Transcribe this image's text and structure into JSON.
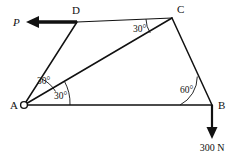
{
  "figure": {
    "background_color": "#ffffff",
    "line_color": "#111111"
  },
  "vertices": {
    "a": {
      "label": "A",
      "x": 24,
      "y": 105,
      "support": "pin-support-circle"
    },
    "b": {
      "label": "B",
      "x": 212,
      "y": 105
    },
    "c": {
      "label": "C",
      "x": 172,
      "y": 18
    },
    "d": {
      "label": "D",
      "x": 77,
      "y": 22
    }
  },
  "members": [
    {
      "name": "member-a-b",
      "from": "A",
      "to": "B"
    },
    {
      "name": "member-a-d",
      "from": "A",
      "to": "D"
    },
    {
      "name": "member-a-c",
      "from": "A",
      "to": "C"
    },
    {
      "name": "member-d-c",
      "from": "D",
      "to": "C"
    },
    {
      "name": "member-c-b",
      "from": "C",
      "to": "B"
    }
  ],
  "angles": [
    {
      "name": "angle-at-a-upper",
      "value": "30°",
      "at": "A",
      "between": "AD and AC",
      "label_x": 37,
      "label_y": 84
    },
    {
      "name": "angle-at-a-lower",
      "value": "30°",
      "at": "A",
      "between": "AC and AB",
      "label_x": 54,
      "label_y": 98
    },
    {
      "name": "angle-at-c",
      "value": "30°",
      "at": "C",
      "between": "CD and CA",
      "label_x": 136,
      "label_y": 32
    },
    {
      "name": "angle-at-b",
      "value": "60°",
      "at": "B",
      "between": "BA and BC",
      "label_x": 183,
      "label_y": 93
    }
  ],
  "forces": [
    {
      "name": "force-p",
      "label": "P",
      "applied_at": "D",
      "direction": "left",
      "style": "thick-horizontal-arrow",
      "label_x": 17,
      "label_y": 25
    },
    {
      "name": "force-300n",
      "label": "300 N",
      "applied_at": "B",
      "direction": "down",
      "magnitude": "300",
      "unit": "N",
      "label_x": 211,
      "label_y": 150
    }
  ]
}
